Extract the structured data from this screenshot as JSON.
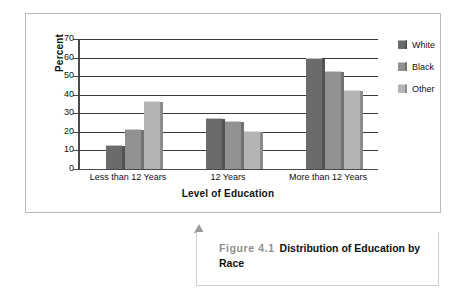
{
  "figure": {
    "caption_number": "Figure 4.1",
    "caption_title": "Distribution of Education by Race",
    "arrow_icon": "up-arrow-marker-icon"
  },
  "legend": {
    "position": "right",
    "items": [
      {
        "label": "White",
        "color": "#6b6b6b",
        "swatch_icon": "legend-swatch-white-series"
      },
      {
        "label": "Black",
        "color": "#919191",
        "swatch_icon": "legend-swatch-black-series"
      },
      {
        "label": "Other",
        "color": "#b4b4b4",
        "swatch_icon": "legend-swatch-other-series"
      }
    ]
  },
  "axes": {
    "y_title": "Percent",
    "x_title": "Level of Education",
    "y_ticks": [
      "70",
      "60",
      "50",
      "40",
      "30",
      "20",
      "10",
      "0"
    ]
  },
  "chart_data": {
    "type": "bar",
    "title": "Distribution of Education by Race",
    "xlabel": "Level of Education",
    "ylabel": "Percent",
    "ylim": [
      0,
      70
    ],
    "ytick_step": 10,
    "grid": true,
    "legend_position": "right",
    "categories": [
      "Less than 12 Years",
      "12 Years",
      "More than 12 Years"
    ],
    "series": [
      {
        "name": "White",
        "color": "#6b6b6b",
        "values": [
          12.5,
          27,
          59
        ]
      },
      {
        "name": "Black",
        "color": "#919191",
        "values": [
          21,
          25.5,
          52
        ]
      },
      {
        "name": "Other",
        "color": "#b4b4b4",
        "values": [
          36,
          20,
          42
        ]
      }
    ]
  }
}
